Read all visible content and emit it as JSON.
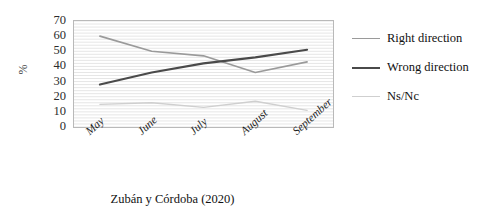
{
  "caption": "Zubán y Córdoba (2020)",
  "axis": {
    "y_title": "%",
    "y_ticks": [
      "70",
      "60",
      "50",
      "40",
      "30",
      "20",
      "10",
      "0"
    ]
  },
  "legend": {
    "items": [
      {
        "label": "Right direction",
        "color": "#9a9a9a",
        "width": 1.6
      },
      {
        "label": "Wrong direction",
        "color": "#4a4a4a",
        "width": 2.1
      },
      {
        "label": "Ns/Nc",
        "color": "#cfcfcf",
        "width": 1.3
      }
    ]
  },
  "chart_data": {
    "type": "line",
    "title": "",
    "xlabel": "",
    "ylabel": "%",
    "categories": [
      "May",
      "June",
      "July",
      "August",
      "September"
    ],
    "ylim": [
      0,
      70
    ],
    "ytick_step": 10,
    "grid": true,
    "legend_position": "right",
    "series": [
      {
        "name": "Right direction",
        "color": "#9a9a9a",
        "values": [
          60,
          50,
          47,
          36,
          43
        ]
      },
      {
        "name": "Wrong direction",
        "color": "#4a4a4a",
        "values": [
          28,
          36,
          42,
          46,
          51
        ]
      },
      {
        "name": "Ns/Nc",
        "color": "#cfcfcf",
        "values": [
          15,
          16,
          13,
          17,
          11
        ]
      }
    ]
  }
}
